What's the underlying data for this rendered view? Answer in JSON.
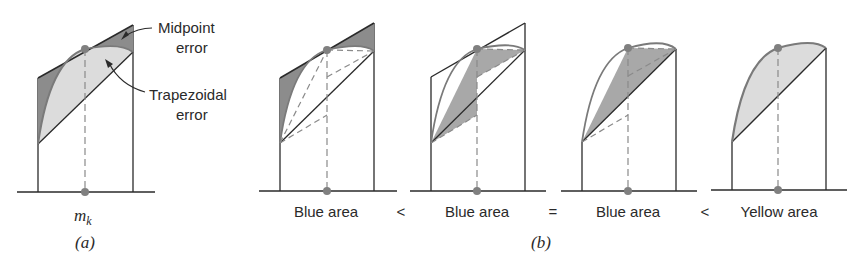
{
  "figure": {
    "colors": {
      "line": "#2a2a2a",
      "curve": "#7a7a7a",
      "dark_fill": "#8c8c8c",
      "mid_fill": "#a8a8a8",
      "light_fill": "#dcdcdc",
      "dash": "#8a8a8a",
      "dot": "#808080"
    },
    "panel_a": {
      "caption": "(a)",
      "midpoint_label": "m",
      "midpoint_subscript": "k",
      "annotations": {
        "midpoint_error_line1": "Midpoint",
        "midpoint_error_line2": "error",
        "trapezoidal_error_line1": "Trapezoidal",
        "trapezoidal_error_line2": "error"
      }
    },
    "panel_b": {
      "caption": "(b)",
      "labels": [
        "Blue area",
        "Blue area",
        "Blue area",
        "Yellow area"
      ],
      "relations": [
        "<",
        "=",
        "<"
      ]
    }
  }
}
